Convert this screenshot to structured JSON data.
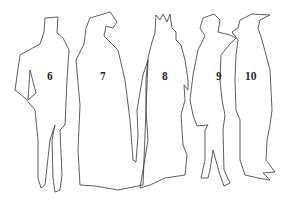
{
  "figures": [
    {
      "number": "6",
      "x": 47,
      "y": 70
    },
    {
      "number": "7",
      "x": 99,
      "y": 70
    },
    {
      "number": "8",
      "x": 161,
      "y": 70
    },
    {
      "number": "9",
      "x": 215,
      "y": 70
    },
    {
      "number": "10",
      "x": 245,
      "y": 70
    }
  ],
  "colors": {
    "stroke": "#333333",
    "background": "#ffffff"
  }
}
